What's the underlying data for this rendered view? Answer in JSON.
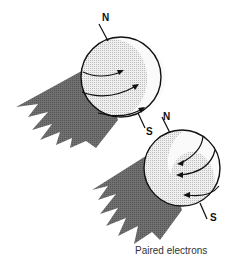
{
  "figure": {
    "caption": "Paired electrons",
    "electrons": [
      {
        "id": "top",
        "north_label": "N",
        "south_label": "S",
        "spin_direction": "counterclockwise-viewed-from-front (arrows point right)"
      },
      {
        "id": "bottom",
        "north_label": "N",
        "south_label": "S",
        "spin_direction": "opposite (arrows point left)"
      }
    ]
  },
  "colors": {
    "sphere_fill": "#e8e8e8",
    "sphere_highlight": "#ffffff",
    "sphere_shade": "#cfcfcf",
    "trail": "#6b6b6b",
    "outline": "#111111"
  }
}
